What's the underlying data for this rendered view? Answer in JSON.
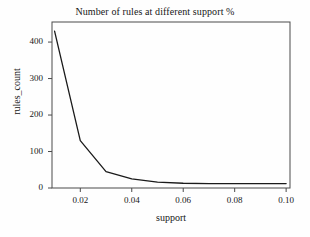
{
  "chart_data": {
    "type": "line",
    "title": "Number of rules at different support %",
    "xlabel": "support",
    "ylabel": "rules_count",
    "xlim": [
      0.009,
      0.1015
    ],
    "ylim": [
      0,
      455
    ],
    "grid": false,
    "legend": null,
    "xticks": [
      "0.02",
      "0.04",
      "0.06",
      "0.08",
      "0.10"
    ],
    "xtick_values": [
      0.02,
      0.04,
      0.06,
      0.08,
      0.1
    ],
    "yticks": [
      "0",
      "100",
      "200",
      "300",
      "400"
    ],
    "ytick_values": [
      0,
      100,
      200,
      300,
      400
    ],
    "series": [
      {
        "name": "rules_count",
        "color": "#1a1a1a",
        "x": [
          0.01,
          0.02,
          0.03,
          0.04,
          0.05,
          0.06,
          0.07,
          0.08,
          0.09,
          0.1
        ],
        "values": [
          430,
          130,
          45,
          25,
          16,
          13,
          12,
          12,
          12,
          12
        ]
      }
    ]
  },
  "figure": {
    "title": "Number of rules at different support %",
    "xlabel": "support",
    "ylabel": "rules_count"
  }
}
